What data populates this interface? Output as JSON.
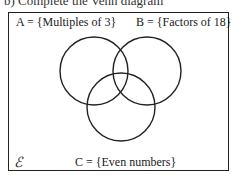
{
  "heading": "b) Complete the Venn diagram",
  "diagram": {
    "universal_symbol": "ℰ",
    "sets": [
      {
        "name": "A",
        "label": "A = {Multiples of 3}",
        "cx": 94,
        "cy": 71,
        "r": 34
      },
      {
        "name": "B",
        "label": "B = {Factors of 18}",
        "cx": 147,
        "cy": 71,
        "r": 34
      },
      {
        "name": "C",
        "label": "C = {Even numbers}",
        "cx": 121,
        "cy": 107,
        "r": 34
      }
    ]
  }
}
